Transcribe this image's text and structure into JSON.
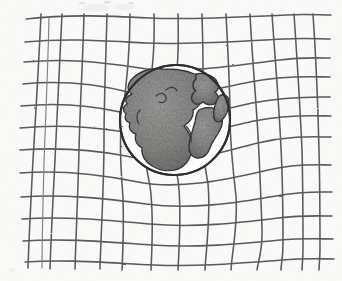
{
  "figure": {
    "title": "Spacetime curvature around Earth",
    "medium": "pencil sketch on paper",
    "alt_text": "A hand-drawn pencil sketch showing a rectangular grid of lines that bends and stretches inward toward a shaded sphere of the Earth resting at the centre, illustrating the warping of spacetime by mass.",
    "background_color": "#fbfbfa",
    "ink_color": "#5a5a5c",
    "outline_color": "#2e2e30",
    "shading_color": "#8a8a8a"
  },
  "grid": {
    "label": "spacetime-grid",
    "vertical_line_count": 14,
    "horizontal_line_count": 12,
    "bounds": {
      "left": 40,
      "top": 14,
      "right": 330,
      "bottom": 266
    },
    "deformation": "lines curve inward and compress toward the central mass"
  },
  "earth": {
    "label": "Earth",
    "center_x": 175,
    "center_y": 120,
    "radius": 55,
    "continents": [
      "North America",
      "South America",
      "Europe",
      "Africa"
    ],
    "ocean_label": "Atlantic Ocean"
  },
  "annotations": {
    "top_marks": "faint pencil tick marks bleeding through from the page above"
  }
}
